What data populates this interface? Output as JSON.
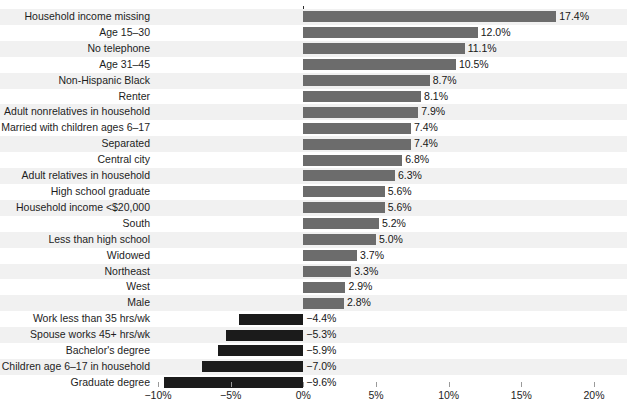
{
  "chart_data": {
    "type": "bar",
    "orientation": "horizontal",
    "title": "",
    "xlabel": "",
    "ylabel": "",
    "xlim": [
      -10,
      20
    ],
    "xticks": [
      -10,
      -5,
      0,
      5,
      10,
      15,
      20
    ],
    "xticklabels": [
      "−10%",
      "−5%",
      "0%",
      "5%",
      "10%",
      "15%",
      "20%"
    ],
    "grid": true,
    "legend": "none",
    "colors": {
      "positive_bar": "#6c6c6c",
      "negative_bar": "#1b1b1b",
      "row_stripe": "#f1f1f1",
      "gridline": "#c9c9c9",
      "zero_axis": "#2a2a2a"
    },
    "categories": [
      "Household income missing",
      "Age 15–30",
      "No telephone",
      "Age 31–45",
      "Non-Hispanic Black",
      "Renter",
      "Adult nonrelatives in household",
      "Married with children ages 6–17",
      "Separated",
      "Central city",
      "Adult relatives in household",
      "High school graduate",
      "Household income <$20,000",
      "South",
      "Less than high school",
      "Widowed",
      "Northeast",
      "West",
      "Male",
      "Work less than 35 hrs/wk",
      "Spouse works 45+ hrs/wk",
      "Bachelor's degree",
      "Children age 6–17 in household",
      "Graduate degree"
    ],
    "values": [
      17.4,
      12.0,
      11.1,
      10.5,
      8.7,
      8.1,
      7.9,
      7.4,
      7.4,
      6.8,
      6.3,
      5.6,
      5.6,
      5.2,
      5.0,
      3.7,
      3.3,
      2.9,
      2.8,
      -4.4,
      -5.3,
      -5.9,
      -7.0,
      -9.6
    ],
    "value_labels": [
      "17.4%",
      "12.0%",
      "11.1%",
      "10.5%",
      "8.7%",
      "8.1%",
      "7.9%",
      "7.4%",
      "7.4%",
      "6.8%",
      "6.3%",
      "5.6%",
      "5.6%",
      "5.2%",
      "5.0%",
      "3.7%",
      "3.3%",
      "2.9%",
      "2.8%",
      "−4.4%",
      "−5.3%",
      "−5.9%",
      "−7.0%",
      "−9.6%"
    ]
  }
}
